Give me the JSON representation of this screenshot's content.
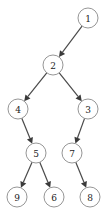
{
  "diagram": {
    "type": "binary-tree",
    "node_radius": 10,
    "colors": {
      "node_stroke": "#8a8a8a",
      "node_fill": "#ffffff",
      "edge": "#4a4a4a",
      "text": "#222222"
    },
    "nodes": [
      {
        "id": "1",
        "label": "1",
        "x": 88,
        "y": 18
      },
      {
        "id": "2",
        "label": "2",
        "x": 53,
        "y": 65
      },
      {
        "id": "4",
        "label": "4",
        "x": 18,
        "y": 109
      },
      {
        "id": "3",
        "label": "3",
        "x": 88,
        "y": 109
      },
      {
        "id": "5",
        "label": "5",
        "x": 36,
        "y": 153
      },
      {
        "id": "7",
        "label": "7",
        "x": 72,
        "y": 153
      },
      {
        "id": "9",
        "label": "9",
        "x": 17,
        "y": 197
      },
      {
        "id": "6",
        "label": "6",
        "x": 54,
        "y": 197
      },
      {
        "id": "8",
        "label": "8",
        "x": 90,
        "y": 197
      }
    ],
    "edges": [
      {
        "from": "1",
        "to": "2"
      },
      {
        "from": "2",
        "to": "4"
      },
      {
        "from": "2",
        "to": "3"
      },
      {
        "from": "4",
        "to": "5"
      },
      {
        "from": "3",
        "to": "7"
      },
      {
        "from": "5",
        "to": "9"
      },
      {
        "from": "5",
        "to": "6"
      },
      {
        "from": "7",
        "to": "8"
      }
    ]
  }
}
